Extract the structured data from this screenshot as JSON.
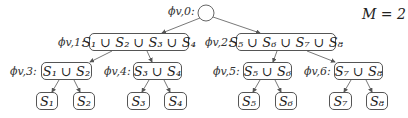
{
  "diagram": {
    "type": "tree",
    "parameter_label": "M = 2",
    "root": {
      "id": "v0",
      "label": "ϕv,0:",
      "shape": "circle"
    },
    "level1": [
      {
        "id": "v1",
        "label": "ϕv,1:",
        "content": "S₁ ∪ S₂ ∪ S₃ ∪ S₄"
      },
      {
        "id": "v2",
        "label": "ϕv,2:",
        "content": "S₅ ∪ S₆ ∪ S₇ ∪ S₈"
      }
    ],
    "level2": [
      {
        "id": "v3",
        "label": "ϕv,3:",
        "content": "S₁ ∪ S₂"
      },
      {
        "id": "v4",
        "label": "ϕv,4:",
        "content": "S₃ ∪ S₄"
      },
      {
        "id": "v5",
        "label": "ϕv,5:",
        "content": "S₅ ∪ S₆"
      },
      {
        "id": "v6",
        "label": "ϕv,6:",
        "content": "S₇ ∪ S₈"
      }
    ],
    "leaves": [
      {
        "id": "s1",
        "content": "S₁"
      },
      {
        "id": "s2",
        "content": "S₂"
      },
      {
        "id": "s3",
        "content": "S₃"
      },
      {
        "id": "s4",
        "content": "S₄"
      },
      {
        "id": "s5",
        "content": "S₅"
      },
      {
        "id": "s6",
        "content": "S₆"
      },
      {
        "id": "s7",
        "content": "S₇"
      },
      {
        "id": "s8",
        "content": "S₈"
      }
    ],
    "edges": [
      [
        "v0",
        "v1"
      ],
      [
        "v0",
        "v2"
      ],
      [
        "v1",
        "v3"
      ],
      [
        "v1",
        "v4"
      ],
      [
        "v2",
        "v5"
      ],
      [
        "v2",
        "v6"
      ],
      [
        "v3",
        "s1"
      ],
      [
        "v3",
        "s2"
      ],
      [
        "v4",
        "s3"
      ],
      [
        "v4",
        "s4"
      ],
      [
        "v5",
        "s5"
      ],
      [
        "v5",
        "s6"
      ],
      [
        "v6",
        "s7"
      ],
      [
        "v6",
        "s8"
      ]
    ],
    "colors": {
      "stroke": "#555555",
      "text": "#222222",
      "background": "#ffffff"
    }
  }
}
